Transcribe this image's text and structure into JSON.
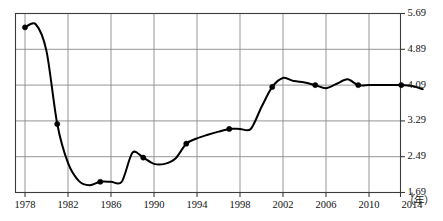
{
  "chart_data": {
    "type": "line",
    "title": "",
    "subtitle": "",
    "xlabel": "（年）",
    "ylabel": "",
    "grid": true,
    "legend": "none",
    "xlim": [
      1978,
      2015
    ],
    "ylim": [
      1.69,
      5.69
    ],
    "x_ticks": [
      1978,
      1982,
      1986,
      1990,
      1994,
      1998,
      2002,
      2006,
      2010,
      2014
    ],
    "x_tick_labels": [
      "1978",
      "1982",
      "1986",
      "1990",
      "1994",
      "1998",
      "2002",
      "2006",
      "2010",
      "2014"
    ],
    "y_ticks": [
      1.69,
      2.49,
      3.29,
      4.09,
      4.89,
      5.69
    ],
    "y_tick_labels": [
      "1.69",
      "2.49",
      "3.29",
      "4.09",
      "4.89",
      "5.69"
    ],
    "series": [
      {
        "name": "series-1",
        "line_color": "#000000",
        "marker_color": "#000000",
        "x": [
          1978,
          1979,
          1980,
          1981,
          1982,
          1983,
          1984,
          1985,
          1986,
          1987,
          1988,
          1989,
          1990,
          1991,
          1992,
          1993,
          1994,
          1995,
          1996,
          1997,
          1998,
          1999,
          2000,
          2001,
          2002,
          2003,
          2004,
          2005,
          2006,
          2007,
          2008,
          2009,
          2010,
          2011,
          2012,
          2013,
          2014,
          2015
        ],
        "values": [
          5.38,
          5.45,
          4.85,
          3.22,
          2.35,
          1.95,
          1.85,
          1.93,
          1.93,
          1.93,
          2.58,
          2.47,
          2.33,
          2.33,
          2.45,
          2.78,
          2.9,
          2.98,
          3.05,
          3.11,
          3.11,
          3.11,
          3.6,
          4.05,
          4.25,
          4.18,
          4.15,
          4.09,
          4.02,
          4.12,
          4.22,
          4.09,
          4.09,
          4.09,
          4.09,
          4.09,
          4.07,
          4.0
        ]
      }
    ],
    "marker_points": [
      {
        "x": 1978,
        "y": 5.38
      },
      {
        "x": 1981,
        "y": 3.22
      },
      {
        "x": 1985,
        "y": 1.93
      },
      {
        "x": 1989,
        "y": 2.47
      },
      {
        "x": 1993,
        "y": 2.78
      },
      {
        "x": 1997,
        "y": 3.11
      },
      {
        "x": 2001,
        "y": 4.05
      },
      {
        "x": 2005,
        "y": 4.09
      },
      {
        "x": 2009,
        "y": 4.09
      },
      {
        "x": 2013,
        "y": 4.09
      }
    ]
  },
  "axis": {
    "unit_label": "（年）"
  }
}
